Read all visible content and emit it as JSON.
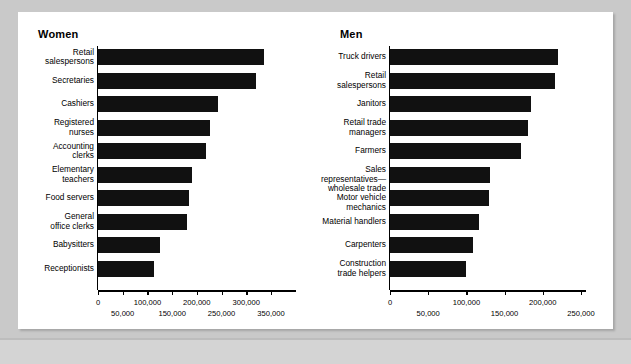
{
  "chart_data": [
    {
      "type": "bar",
      "orientation": "horizontal",
      "title": "Women",
      "xlabel": "",
      "ylabel": "",
      "xlim": [
        0,
        350000
      ],
      "grid": false,
      "legend": null,
      "tick_labels": [
        "0",
        "50,000",
        "100,000",
        "150,000",
        "200,000",
        "250,000",
        "300,000",
        "350,000"
      ],
      "tick_values": [
        0,
        50000,
        100000,
        150000,
        200000,
        250000,
        300000,
        350000
      ],
      "categories": [
        "Retail\nsalespersons",
        "Secretaries",
        "Cashiers",
        "Registered\nnurses",
        "Accounting\nclerks",
        "Elementary\nteachers",
        "Food servers",
        "General\noffice clerks",
        "Babysitters",
        "Receptionists"
      ],
      "values": [
        335000,
        320000,
        242000,
        227000,
        219000,
        190000,
        185000,
        180000,
        126000,
        113000
      ]
    },
    {
      "type": "bar",
      "orientation": "horizontal",
      "title": "Men",
      "xlabel": "",
      "ylabel": "",
      "xlim": [
        0,
        250000
      ],
      "grid": false,
      "legend": null,
      "tick_labels": [
        "0",
        "50,000",
        "100,000",
        "150,000",
        "200,000",
        "250,000"
      ],
      "tick_values": [
        0,
        50000,
        100000,
        150000,
        200000,
        250000
      ],
      "categories": [
        "Truck drivers",
        "Retail\nsalespersons",
        "Janitors",
        "Retail trade\nmanagers",
        "Farmers",
        "Sales representatives—\nwholesale trade",
        "Motor vehicle mechanics",
        "Material handlers",
        "Carpenters",
        "Construction\ntrade helpers"
      ],
      "values": [
        220000,
        216000,
        185000,
        181000,
        172000,
        131000,
        129000,
        117000,
        108000,
        100000
      ]
    }
  ],
  "colors": {
    "bar": "#111111",
    "panel_background": "#ffffff",
    "page_background": "#c9c9c9",
    "axis": "#000000",
    "bottom_band": "#d4d4d4"
  }
}
